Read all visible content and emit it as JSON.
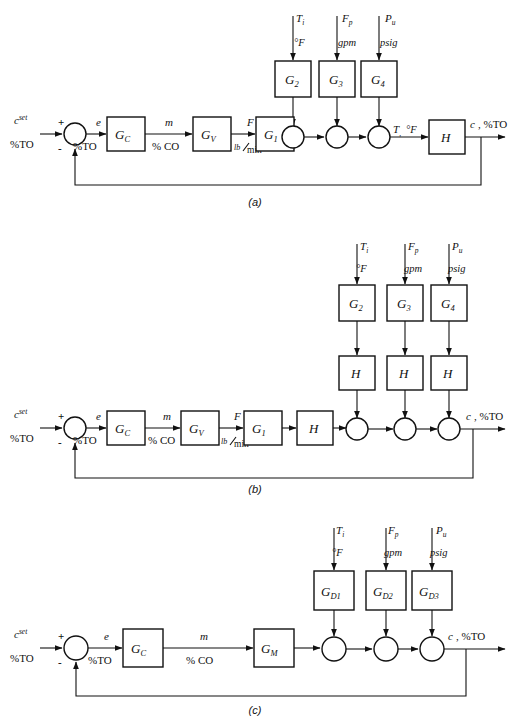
{
  "figure": {
    "type": "control-system-block-diagram",
    "captions": {
      "a": "(a)",
      "b": "(b)",
      "c": "(c)"
    }
  },
  "common": {
    "setpoint": "c",
    "setpoint_sup": "set",
    "setpoint_unit": "%TO",
    "plus": "+",
    "minus": "-",
    "error": "e",
    "error_unit": "%TO",
    "controller_output": "m",
    "controller_output_unit": "% CO",
    "flow": "F",
    "flow_unit_num": "lb",
    "flow_unit_den": "min",
    "temp_signal": "T",
    "temp_signal_unit": "°F",
    "output": "c",
    "output_unit": ", %TO"
  },
  "disturbances": [
    {
      "symbol": "T",
      "subscript": "i",
      "unit": "°F"
    },
    {
      "symbol": "F",
      "subscript": "p",
      "unit": "gpm"
    },
    {
      "symbol": "P",
      "subscript": "u",
      "unit": "psig"
    }
  ],
  "diagram_a": {
    "label": "(a)",
    "forward_blocks": [
      {
        "name": "G",
        "sub": "C"
      },
      {
        "name": "G",
        "sub": "V"
      },
      {
        "name": "G",
        "sub": "1"
      }
    ],
    "disturbance_blocks": [
      {
        "name": "G",
        "sub": "2"
      },
      {
        "name": "G",
        "sub": "3"
      },
      {
        "name": "G",
        "sub": "4"
      }
    ],
    "sensor_block": {
      "name": "H",
      "sub": ""
    },
    "summing_junctions": 3,
    "feedback": true
  },
  "diagram_b": {
    "label": "(b)",
    "forward_blocks": [
      {
        "name": "G",
        "sub": "C"
      },
      {
        "name": "G",
        "sub": "V"
      },
      {
        "name": "G",
        "sub": "1"
      },
      {
        "name": "H",
        "sub": ""
      }
    ],
    "disturbance_blocks": [
      {
        "name": "G",
        "sub": "2"
      },
      {
        "name": "G",
        "sub": "3"
      },
      {
        "name": "G",
        "sub": "4"
      }
    ],
    "disturbance_sensor_blocks": [
      {
        "name": "H",
        "sub": ""
      },
      {
        "name": "H",
        "sub": ""
      },
      {
        "name": "H",
        "sub": ""
      }
    ],
    "summing_junctions": 3,
    "feedback": true
  },
  "diagram_c": {
    "label": "(c)",
    "forward_blocks": [
      {
        "name": "G",
        "sub": "C"
      },
      {
        "name": "G",
        "sub": "M"
      }
    ],
    "disturbance_blocks": [
      {
        "name": "G",
        "sub": "D1"
      },
      {
        "name": "G",
        "sub": "D2"
      },
      {
        "name": "G",
        "sub": "D3"
      }
    ],
    "summing_junctions": 3,
    "feedback": true
  },
  "colors": {
    "line": "#111111",
    "fill": "#ffffff",
    "background": "#ffffff"
  }
}
